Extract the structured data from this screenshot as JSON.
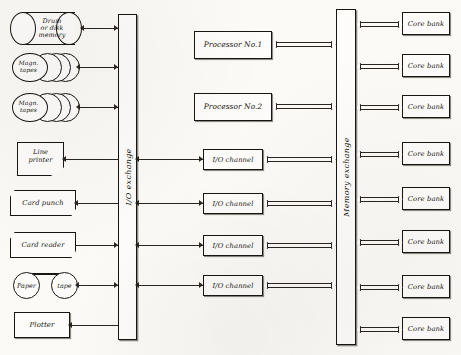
{
  "diagram": {
    "ink_color": "#191612",
    "paper_color": "#fbfaf7"
  },
  "exchanges": [
    {
      "name": "io-exchange",
      "label": "I/O exchange"
    },
    {
      "name": "memory-exchange",
      "label": "Memory exchange"
    }
  ],
  "peripherals": [
    {
      "name": "drum-or-disk-memory",
      "label": "Drum\nor disk\nmemory",
      "shape": "cylinder"
    },
    {
      "name": "magnetic-tapes-1",
      "label": "Magn.\ntapes",
      "shape": "reel-stack"
    },
    {
      "name": "magnetic-tapes-2",
      "label": "Magn.\ntapes",
      "shape": "reel-stack"
    },
    {
      "name": "line-printer",
      "label": "Line\nprinter",
      "shape": "torn-paper"
    },
    {
      "name": "card-punch",
      "label": "Card punch",
      "shape": "card-slab"
    },
    {
      "name": "card-reader",
      "label": "Card reader",
      "shape": "card-slab"
    },
    {
      "name": "paper-tape",
      "label": "Paper tape",
      "shape": "twin-circle",
      "left_label": "Paper",
      "right_label": "tape"
    },
    {
      "name": "plotter",
      "label": "Plotter",
      "shape": "rect"
    }
  ],
  "processors": [
    {
      "name": "processor-1",
      "label": "Processor No.1"
    },
    {
      "name": "processor-2",
      "label": "Processor No.2"
    }
  ],
  "io_channels": [
    {
      "name": "io-channel-1",
      "label": "I/O channel"
    },
    {
      "name": "io-channel-2",
      "label": "I/O channel"
    },
    {
      "name": "io-channel-3",
      "label": "I/O channel"
    },
    {
      "name": "io-channel-4",
      "label": "I/O channel"
    }
  ],
  "core_banks": [
    {
      "name": "core-bank-1",
      "label": "Core bank"
    },
    {
      "name": "core-bank-2",
      "label": "Core bank"
    },
    {
      "name": "core-bank-3",
      "label": "Core bank"
    },
    {
      "name": "core-bank-4",
      "label": "Core bank"
    },
    {
      "name": "core-bank-5",
      "label": "Core bank"
    },
    {
      "name": "core-bank-6",
      "label": "Core bank"
    },
    {
      "name": "core-bank-7",
      "label": "Core bank"
    },
    {
      "name": "core-bank-8",
      "label": "Core bank"
    }
  ]
}
